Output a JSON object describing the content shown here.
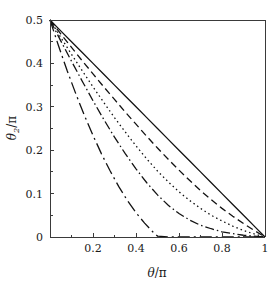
{
  "figure": {
    "background_color": "#ffffff",
    "curve_color": "#121212",
    "axis_color": "#3a3a3a"
  },
  "axes": {
    "x_axis_label_main": "θ",
    "x_axis_label_denom": "/π",
    "y_axis_label_main": "θ",
    "y_axis_label_sub": "2",
    "y_axis_label_denom": "/π",
    "x_tick_labels": [
      "0.2",
      "0.4",
      "0.6",
      "0.8",
      "1"
    ],
    "y_tick_labels": [
      "0",
      "0.1",
      "0.2",
      "0.3",
      "0.4",
      "0.5"
    ],
    "x_origin_label": "0"
  },
  "chart_data": {
    "type": "line",
    "title": "",
    "xlabel": "θ/π",
    "ylabel": "θ₂/π",
    "xlim": [
      0,
      1
    ],
    "ylim": [
      0,
      0.5
    ],
    "xticks": [
      0,
      0.2,
      0.4,
      0.6,
      0.8,
      1
    ],
    "yticks": [
      0,
      0.1,
      0.2,
      0.3,
      0.4,
      0.5
    ],
    "x_minor_ticks": [
      0.1,
      0.3,
      0.5,
      0.7,
      0.9
    ],
    "y_minor_ticks": [
      0.05,
      0.15,
      0.25,
      0.35,
      0.45
    ],
    "grid": false,
    "legend": "none",
    "series": [
      {
        "name": "curve-1-solid",
        "linestyle": "solid",
        "dasharray": "none",
        "x": [
          0.0,
          0.05,
          0.1,
          0.15,
          0.2,
          0.25,
          0.3,
          0.35,
          0.4,
          0.45,
          0.5,
          0.55,
          0.6,
          0.65,
          0.7,
          0.75,
          0.8,
          0.85,
          0.9,
          0.95,
          1.0
        ],
        "y": [
          0.5,
          0.475,
          0.45,
          0.425,
          0.4,
          0.375,
          0.35,
          0.325,
          0.3,
          0.275,
          0.25,
          0.225,
          0.2,
          0.175,
          0.15,
          0.125,
          0.1,
          0.075,
          0.05,
          0.025,
          0.0
        ]
      },
      {
        "name": "curve-2-dashed",
        "linestyle": "dashed",
        "dasharray": "7,4",
        "x": [
          0.0,
          0.05,
          0.1,
          0.15,
          0.2,
          0.25,
          0.3,
          0.35,
          0.4,
          0.45,
          0.5,
          0.55,
          0.6,
          0.65,
          0.7,
          0.75,
          0.8,
          0.85,
          0.9,
          0.95,
          1.0
        ],
        "y": [
          0.5,
          0.468,
          0.437,
          0.406,
          0.376,
          0.346,
          0.317,
          0.288,
          0.26,
          0.232,
          0.205,
          0.179,
          0.154,
          0.13,
          0.107,
          0.086,
          0.066,
          0.048,
          0.031,
          0.015,
          0.0
        ]
      },
      {
        "name": "curve-3-dotted",
        "linestyle": "dotted",
        "dasharray": "1.5,3",
        "x": [
          0.0,
          0.05,
          0.1,
          0.15,
          0.2,
          0.25,
          0.3,
          0.35,
          0.4,
          0.45,
          0.5,
          0.55,
          0.6,
          0.65,
          0.7,
          0.75,
          0.8,
          0.85,
          0.9,
          0.95,
          1.0
        ],
        "y": [
          0.5,
          0.46,
          0.421,
          0.383,
          0.346,
          0.31,
          0.275,
          0.242,
          0.21,
          0.18,
          0.152,
          0.127,
          0.104,
          0.084,
          0.066,
          0.05,
          0.037,
          0.025,
          0.015,
          0.007,
          0.0
        ]
      },
      {
        "name": "curve-4-dashdot",
        "linestyle": "dashdot",
        "dasharray": "9,3,1.5,3",
        "x": [
          0.0,
          0.05,
          0.1,
          0.15,
          0.2,
          0.25,
          0.3,
          0.35,
          0.4,
          0.45,
          0.5,
          0.55,
          0.6,
          0.65,
          0.7,
          0.75,
          0.8,
          0.85,
          0.9,
          0.95,
          1.0
        ],
        "y": [
          0.5,
          0.452,
          0.405,
          0.359,
          0.314,
          0.271,
          0.23,
          0.192,
          0.157,
          0.125,
          0.097,
          0.073,
          0.054,
          0.039,
          0.027,
          0.019,
          0.012,
          0.008,
          0.004,
          0.002,
          0.0
        ]
      },
      {
        "name": "curve-5-longdashdot",
        "linestyle": "longdashdot",
        "dasharray": "12,4,2,4",
        "x": [
          0.0,
          0.04,
          0.08,
          0.12,
          0.16,
          0.2,
          0.24,
          0.28,
          0.32,
          0.36,
          0.4,
          0.44,
          0.48,
          0.5,
          0.55,
          0.6,
          0.7,
          0.8,
          0.9,
          1.0
        ],
        "y": [
          0.5,
          0.44,
          0.383,
          0.33,
          0.28,
          0.234,
          0.191,
          0.152,
          0.116,
          0.084,
          0.056,
          0.032,
          0.011,
          0.002,
          0.0,
          0.0,
          0.0,
          0.0,
          0.0,
          0.0
        ]
      }
    ]
  }
}
